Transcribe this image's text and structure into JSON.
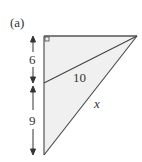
{
  "figure": {
    "label": "(a)",
    "segments": {
      "upper_left": "6",
      "lower_left": "9",
      "hypotenuse_inner": "10",
      "hypotenuse_outer": "x"
    },
    "colors": {
      "fill": "#f0f0f0",
      "stroke": "#444444"
    }
  }
}
